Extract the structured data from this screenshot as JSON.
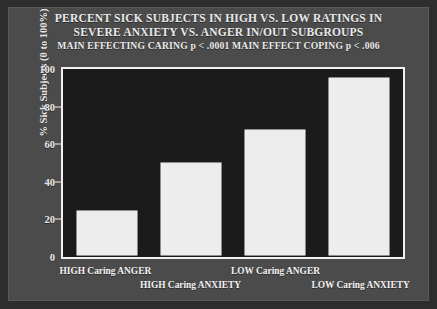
{
  "slide": {
    "title_line_1": "PERCENT SICK SUBJECTS IN HIGH VS. LOW RATINGS IN",
    "title_line_2": "SEVERE ANXIETY VS. ANGER IN/OUT SUBGROUPS",
    "title_line_3": "MAIN EFFECTING CARING p < .0001 MAIN EFFECT COPING p < .006",
    "background_color": "#4b4b4b",
    "plot_background_color": "#1b1b1b",
    "bar_color": "#ededed",
    "text_color": "#e9e9e9"
  },
  "chart_data": {
    "type": "bar",
    "title": "PERCENT SICK SUBJECTS IN HIGH VS. LOW RATINGS IN SEVERE ANXIETY VS. ANGER IN/OUT SUBGROUPS",
    "subtitle": "MAIN EFFECTING CARING p < .0001 MAIN EFFECT COPING p < .006",
    "categories": [
      "HIGH Caring ANGER",
      "HIGH Caring ANXIETY",
      "LOW Caring ANGER",
      "LOW Caring ANXIETY"
    ],
    "values": [
      24,
      50,
      68,
      96
    ],
    "xlabel": "",
    "ylabel": "% Sick Subjects (0 to 100%)",
    "ylim": [
      0,
      100
    ],
    "yticks": [
      0,
      20,
      40,
      60,
      80,
      100
    ],
    "ytick_labels": [
      "0",
      "20",
      "40",
      "60",
      "80",
      "100"
    ],
    "grid": false,
    "legend": false
  }
}
